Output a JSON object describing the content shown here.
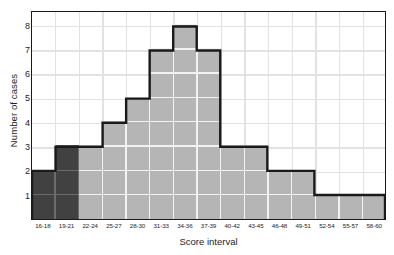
{
  "chart_data": {
    "type": "bar",
    "title": "",
    "xlabel": "Score interval",
    "ylabel": "Number of cases",
    "categories": [
      "16-18",
      "19-21",
      "22-24",
      "25-27",
      "28-30",
      "31-33",
      "34-36",
      "37-39",
      "40-42",
      "43-45",
      "46-48",
      "49-51",
      "52-54",
      "55-57",
      "58-60"
    ],
    "values": [
      2,
      3,
      3,
      4,
      5,
      7,
      8,
      7,
      3,
      3,
      2,
      2,
      1,
      1,
      1
    ],
    "bar_colors": [
      "#414141",
      "#414141",
      "#b5b5b5",
      "#b5b5b5",
      "#b5b5b5",
      "#b5b5b5",
      "#b5b5b5",
      "#b5b5b5",
      "#b5b5b5",
      "#b5b5b5",
      "#b5b5b5",
      "#b5b5b5",
      "#b5b5b5",
      "#b5b5b5",
      "#b5b5b5"
    ],
    "ylim": [
      0,
      8.6
    ],
    "yticks": [
      1,
      2,
      3,
      4,
      5,
      6,
      7,
      8
    ],
    "ytick_labels": [
      "1",
      "2",
      "3",
      "4",
      "5",
      "6",
      "7",
      "8"
    ],
    "grid": true,
    "legend": null,
    "colors": {
      "bar_light": "#b5b5b5",
      "bar_dark": "#414141",
      "outline": "#1a1a1a",
      "gridline": "#e2e2e2",
      "overlay_grid_light": "#f2f2f2",
      "overlay_grid_dark": "#6b6b6b",
      "background": "#ffffff",
      "text": "#1c1c1c"
    }
  }
}
